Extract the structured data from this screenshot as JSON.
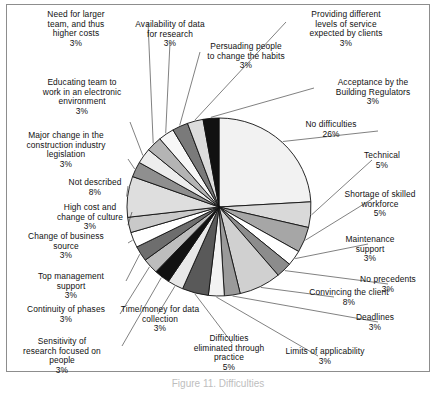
{
  "figure": {
    "caption": "Figure 11. Difficulties",
    "border_color": "#8d8d8d",
    "background": "#ffffff"
  },
  "chart_data": {
    "type": "pie",
    "title": "",
    "xlabel": "",
    "ylabel": "",
    "legend_position": "none",
    "labels_outside": true,
    "start_angle_deg": 0,
    "direction": "clockwise",
    "total_percent": 100,
    "categories": [
      "No difficulties",
      "Technical",
      "Shortage of skilled workforce",
      "Maintenance support",
      "No precedents",
      "Convincing the client",
      "Deadlines",
      "Limits of applicability",
      "Difficulties eliminated through practice",
      "Time/money for data collection",
      "Sensitivity of research focused on people",
      "Continuity of phases",
      "Top management support",
      "Change of business source",
      "High cost and change of culture",
      "Not described",
      "Major change in the construction industry legislation",
      "Educating team to work in an electronic environment",
      "Need for larger team, and thus higher costs",
      "Availability of data for research",
      "Persuading people to change the habits",
      "Providing different levels of service expected by clients",
      "Acceptance by the Building Regulators"
    ],
    "values": [
      26,
      5,
      5,
      3,
      3,
      8,
      3,
      3,
      5,
      3,
      3,
      3,
      3,
      3,
      3,
      8,
      3,
      3,
      3,
      3,
      3,
      3,
      3
    ],
    "value_labels": [
      "26%",
      "5%",
      "5%",
      "3%",
      "3%",
      "8%",
      "3%",
      "3%",
      "5%",
      "3%",
      "3%",
      "3%",
      "3%",
      "3%",
      "3%",
      "8%",
      "3%",
      "3%",
      "3%",
      "3%",
      "3%",
      "3%",
      "3%"
    ],
    "colors": [
      "#f2f2f2",
      "#d9d9d9",
      "#a6a6a6",
      "#ffffff",
      "#8c8c8c",
      "#d0d0d0",
      "#9a9a9a",
      "#f2f2f2",
      "#595959",
      "#e8e8e8",
      "#111111",
      "#bdbdbd",
      "#6e6e6e",
      "#ffffff",
      "#c9c9c9",
      "#dedede",
      "#8f8f8f",
      "#ededed",
      "#b4b4b4",
      "#f7f7f7",
      "#7a7a7a",
      "#dcdcdc",
      "#111111"
    ]
  },
  "slice_labels": [
    {
      "name": "no-difficulties",
      "text": "No difficulties",
      "pct": "26%"
    },
    {
      "name": "technical",
      "text": "Technical",
      "pct": "5%"
    },
    {
      "name": "shortage-of-skilled-workforce",
      "text": "Shortage of skilled\nworkforce",
      "pct": "5%"
    },
    {
      "name": "maintenance-support",
      "text": "Maintenance\nsupport",
      "pct": "3%"
    },
    {
      "name": "no-precedents",
      "text": "No precedents",
      "pct": "3%"
    },
    {
      "name": "convincing-the-client",
      "text": "Convincing the client",
      "pct": "8%"
    },
    {
      "name": "deadlines",
      "text": "Deadlines",
      "pct": "3%"
    },
    {
      "name": "limits-of-applicability",
      "text": "Limits of applicability",
      "pct": "3%"
    },
    {
      "name": "difficulties-eliminated-through-practice",
      "text": "Difficulties\neliminated through\npractice",
      "pct": "5%"
    },
    {
      "name": "time-money-for-data-collection",
      "text": "Time/money for data\ncollection",
      "pct": "3%"
    },
    {
      "name": "sensitivity-of-research-focused-on-people",
      "text": "Sensitivity of\nresearch focused on\npeople",
      "pct": "3%"
    },
    {
      "name": "continuity-of-phases",
      "text": "Continuity of phases",
      "pct": "3%"
    },
    {
      "name": "top-management-support",
      "text": "Top management\nsupport",
      "pct": "3%"
    },
    {
      "name": "change-of-business-source",
      "text": "Change of business\nsource",
      "pct": "3%"
    },
    {
      "name": "high-cost-and-change-of-culture",
      "text": "High cost and\nchange of culture",
      "pct": "3%"
    },
    {
      "name": "not-described",
      "text": "Not described",
      "pct": "8%"
    },
    {
      "name": "major-change-in-legislation",
      "text": "Major change in the\nconstruction industry\nlegislation",
      "pct": "3%"
    },
    {
      "name": "educating-team-electronic-environment",
      "text": "Educating team to\nwork in an electronic\nenvironment",
      "pct": "3%"
    },
    {
      "name": "need-for-larger-team",
      "text": "Need for larger\nteam, and thus\nhigher costs",
      "pct": "3%"
    },
    {
      "name": "availability-of-data-for-research",
      "text": "Availability of data\nfor research",
      "pct": "3%"
    },
    {
      "name": "persuading-people-to-change-habits",
      "text": "Persuading people\nto change the habits",
      "pct": "3%"
    },
    {
      "name": "providing-different-levels-of-service",
      "text": "Providing different\nlevels of service\nexpected by clients",
      "pct": "3%"
    },
    {
      "name": "acceptance-by-building-regulators",
      "text": "Acceptance by the\nBuilding Regulators",
      "pct": "3%"
    }
  ]
}
